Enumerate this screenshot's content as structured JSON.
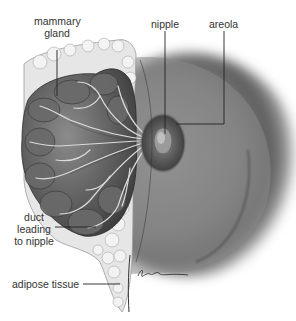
{
  "diagram": {
    "labels": {
      "mammary_gland_line1": "mammary",
      "mammary_gland_line2": "gland",
      "nipple": "nipple",
      "areola": "areola",
      "duct_line1": "duct",
      "duct_line2": "leading",
      "duct_line3": "to nipple",
      "adipose": "adipose tissue"
    },
    "signature": "R.Ewin",
    "colors": {
      "background": "#ffffff",
      "label_text": "#333333",
      "leader_line": "#222222",
      "skin_shadow": "#6a6a6a",
      "gland_lobes": "#5a5a5a",
      "adipose_fat": "#e4e4e4",
      "areola": "#555555"
    }
  }
}
